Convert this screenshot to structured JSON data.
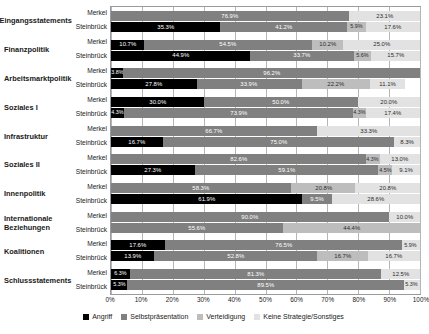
{
  "chart_data": {
    "type": "bar",
    "orientation": "horizontal",
    "stacked": true,
    "normalized": true,
    "title": "",
    "xlabel": "",
    "ylabel": "",
    "xlim": [
      0,
      100
    ],
    "xticks": [
      "0%",
      "10%",
      "20%",
      "30%",
      "40%",
      "50%",
      "60%",
      "70%",
      "80%",
      "90%",
      "100%"
    ],
    "grid": true,
    "legend_position": "bottom",
    "legend": [
      "Angriff",
      "Selbstpräsentation",
      "Verteidigung",
      "Keine Strategie/Sonstiges"
    ],
    "colors": [
      "#000000",
      "#808080",
      "#bdbdbd",
      "#e2e2e2"
    ],
    "speakers": [
      "Merkel",
      "Steinbrück"
    ],
    "categories": [
      "Eingangsstatements",
      "Finanzpolitik",
      "Arbeitsmarktpolitik",
      "Soziales I",
      "Infrastruktur",
      "Soziales II",
      "Innenpolitik",
      "Internationale Beziehungen",
      "Koalitionen",
      "Schlussstatements"
    ],
    "groups": [
      {
        "category": "Eingangsstatements",
        "bars": [
          {
            "speaker": "Merkel",
            "values": [
              0.0,
              76.9,
              0.0,
              23.1
            ],
            "labels": [
              "",
              "76.9%",
              "",
              "23.1%"
            ]
          },
          {
            "speaker": "Steinbrück",
            "values": [
              35.3,
              41.2,
              5.9,
              17.6
            ],
            "labels": [
              "35.3%",
              "41.2%",
              "5.9%",
              "17.6%"
            ]
          }
        ]
      },
      {
        "category": "Finanzpolitik",
        "bars": [
          {
            "speaker": "Merkel",
            "values": [
              10.7,
              54.5,
              10.2,
              25.0
            ],
            "labels": [
              "10.7%",
              "54.5%",
              "10.2%",
              "25.0%"
            ]
          },
          {
            "speaker": "Steinbrück",
            "values": [
              44.9,
              33.7,
              5.6,
              15.7
            ],
            "labels": [
              "44.9%",
              "33.7%",
              "5.6%",
              "15.7%"
            ]
          }
        ]
      },
      {
        "category": "Arbeitsmarktpolitik",
        "bars": [
          {
            "speaker": "Merkel",
            "values": [
              3.8,
              96.2,
              0.0,
              0.0
            ],
            "labels": [
              "3.8%",
              "96.2%",
              "",
              ""
            ]
          },
          {
            "speaker": "Steinbrück",
            "values": [
              27.8,
              33.9,
              22.2,
              11.1
            ],
            "labels": [
              "27.8%",
              "33.9%",
              "22.2%",
              "11.1%"
            ]
          }
        ]
      },
      {
        "category": "Soziales I",
        "bars": [
          {
            "speaker": "Merkel",
            "values": [
              30.0,
              50.0,
              0.0,
              20.0
            ],
            "labels": [
              "30.0%",
              "50.0%",
              "",
              "20.0%"
            ]
          },
          {
            "speaker": "Steinbrück",
            "values": [
              4.3,
              73.9,
              4.3,
              17.4
            ],
            "labels": [
              "4.3%",
              "73.9%",
              "4.3%",
              "17.4%"
            ]
          }
        ]
      },
      {
        "category": "Infrastruktur",
        "bars": [
          {
            "speaker": "Merkel",
            "values": [
              0.0,
              66.7,
              0.0,
              33.3
            ],
            "labels": [
              "",
              "66.7%",
              "",
              "33.3%"
            ]
          },
          {
            "speaker": "Steinbrück",
            "values": [
              16.7,
              75.0,
              0.0,
              8.3
            ],
            "labels": [
              "16.7%",
              "75.0%",
              "",
              "8.3%"
            ]
          }
        ]
      },
      {
        "category": "Soziales II",
        "bars": [
          {
            "speaker": "Merkel",
            "values": [
              0.0,
              82.6,
              4.3,
              13.0
            ],
            "labels": [
              "",
              "82.6%",
              "4.3%",
              "13.0%"
            ]
          },
          {
            "speaker": "Steinbrück",
            "values": [
              27.3,
              59.1,
              4.5,
              9.1
            ],
            "labels": [
              "27.3%",
              "59.1%",
              "4.5%",
              "9.1%"
            ]
          }
        ]
      },
      {
        "category": "Innenpolitik",
        "bars": [
          {
            "speaker": "Merkel",
            "values": [
              0.0,
              58.3,
              20.8,
              20.8
            ],
            "labels": [
              "",
              "58.3%",
              "20.8%",
              "20.8%"
            ]
          },
          {
            "speaker": "Steinbrück",
            "values": [
              61.9,
              9.5,
              0.0,
              28.6
            ],
            "labels": [
              "61.9%",
              "9.5%",
              "",
              "28.6%"
            ]
          }
        ]
      },
      {
        "category": "Internationale Beziehungen",
        "bars": [
          {
            "speaker": "Merkel",
            "values": [
              0.0,
              90.0,
              0.0,
              10.0
            ],
            "labels": [
              "",
              "90.0%",
              "",
              "10.0%"
            ]
          },
          {
            "speaker": "Steinbrück",
            "values": [
              0.0,
              55.6,
              44.4,
              0.0
            ],
            "labels": [
              "",
              "55.6%",
              "44.4%",
              ""
            ]
          }
        ]
      },
      {
        "category": "Koalitionen",
        "bars": [
          {
            "speaker": "Merkel",
            "values": [
              17.6,
              76.5,
              0.0,
              5.9
            ],
            "labels": [
              "17.6%",
              "76.5%",
              "",
              "5.9%"
            ]
          },
          {
            "speaker": "Steinbrück",
            "values": [
              13.9,
              52.8,
              16.7,
              16.7
            ],
            "labels": [
              "13.9%",
              "52.8%",
              "16.7%",
              "16.7%"
            ]
          }
        ]
      },
      {
        "category": "Schlussstatements",
        "bars": [
          {
            "speaker": "Merkel",
            "values": [
              6.3,
              81.3,
              0.0,
              12.5
            ],
            "labels": [
              "6.3%",
              "81.3%",
              "",
              "12.5%"
            ]
          },
          {
            "speaker": "Steinbrück",
            "values": [
              5.3,
              89.5,
              0.0,
              5.3
            ],
            "labels": [
              "5.3%",
              "89.5%",
              "",
              "5.3%"
            ]
          }
        ]
      }
    ]
  }
}
